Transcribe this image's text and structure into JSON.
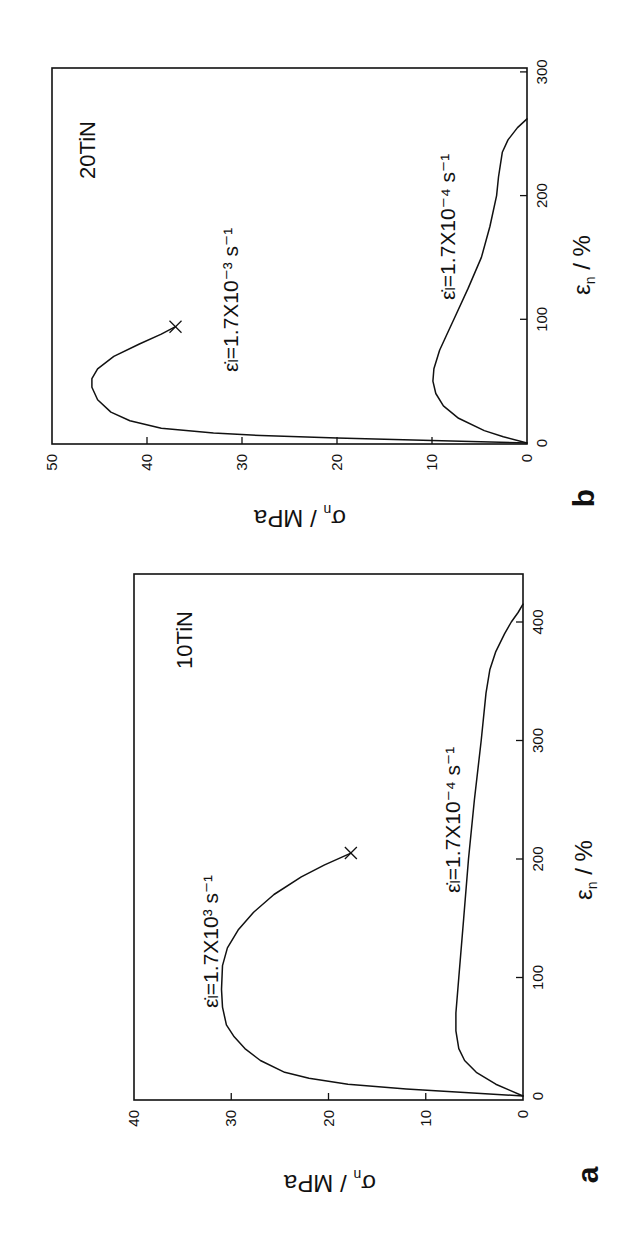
{
  "figure": {
    "rotation_note": "Both panels are printed rotated 90° counter-clockwise on the page",
    "panels": [
      {
        "id": "b",
        "letter": "b",
        "sample": "20TiN",
        "xlabel": "ε",
        "xlabel_sub": "n",
        "xlabel_unit": " / %",
        "ylabel": "σ",
        "ylabel_sub": "n",
        "ylabel_unit": " / MPa",
        "xticks": [
          "0",
          "100",
          "200",
          "300"
        ],
        "yticks": [
          "0",
          "10",
          "20",
          "30",
          "40",
          "50"
        ],
        "series_labels": {
          "high": "ε̇ₗ=1.7X10⁻³ s⁻¹",
          "low": "ε̇ₗ=1.7X10⁻⁴ s⁻¹"
        }
      },
      {
        "id": "a",
        "letter": "a",
        "sample": "10TiN",
        "xlabel": "ε",
        "xlabel_sub": "n",
        "xlabel_unit": " / %",
        "ylabel": "σ",
        "ylabel_sub": "n",
        "ylabel_unit": " / MPa",
        "xticks": [
          "0",
          "100",
          "200",
          "300",
          "400"
        ],
        "yticks": [
          "0",
          "10",
          "20",
          "30",
          "40"
        ],
        "series_labels": {
          "high": "ε̇ₗ=1.7X10³ s⁻¹",
          "low": "ε̇ₗ=1.7X10⁻⁴ s⁻¹"
        }
      }
    ]
  },
  "chart_data": [
    {
      "type": "line",
      "panel": "a",
      "title": "10TiN",
      "xlabel": "εn / %",
      "ylabel": "σn / MPa",
      "xlim": [
        0,
        420
      ],
      "ylim": [
        0,
        40
      ],
      "xticks": [
        0,
        100,
        200,
        300,
        400
      ],
      "yticks": [
        0,
        10,
        20,
        30,
        40
      ],
      "grid": false,
      "series": [
        {
          "name": "ε̇=1.7x10^-3 s^-1",
          "marker_end": "x",
          "x": [
            0,
            3,
            6,
            10,
            15,
            20,
            30,
            40,
            50,
            60,
            75,
            90,
            110,
            125,
            140,
            155,
            170,
            185,
            195,
            205
          ],
          "y": [
            0,
            6,
            12,
            18,
            22,
            24.5,
            27,
            28.6,
            29.7,
            30.5,
            30.9,
            31.0,
            30.9,
            30.4,
            29.3,
            27.7,
            25.6,
            22.8,
            20.4,
            17.7
          ]
        },
        {
          "name": "ε̇=1.7x10^-4 s^-1",
          "x": [
            0,
            5,
            10,
            20,
            30,
            40,
            55,
            70,
            100,
            150,
            200,
            250,
            300,
            340,
            360,
            375,
            390,
            400,
            408,
            415
          ],
          "y": [
            0,
            1.4,
            2.8,
            4.8,
            6.0,
            6.6,
            6.9,
            6.9,
            6.6,
            6.1,
            5.6,
            5.0,
            4.3,
            3.8,
            3.4,
            2.8,
            1.9,
            1.2,
            0.5,
            0
          ]
        }
      ]
    },
    {
      "type": "line",
      "panel": "b",
      "title": "20TiN",
      "xlabel": "εn / %",
      "ylabel": "σn / MPa",
      "xlim": [
        0,
        300
      ],
      "ylim": [
        0,
        50
      ],
      "xticks": [
        0,
        100,
        200,
        300
      ],
      "yticks": [
        0,
        10,
        20,
        30,
        40,
        50
      ],
      "grid": false,
      "series": [
        {
          "name": "ε̇=1.7x10^-3 s^-1",
          "marker_end": "x",
          "x": [
            0,
            2,
            4,
            6,
            8,
            12,
            18,
            25,
            35,
            45,
            52,
            60,
            70,
            80,
            88,
            94
          ],
          "y": [
            0,
            10,
            20,
            28,
            33,
            38.5,
            41.8,
            43.8,
            45.2,
            45.8,
            45.8,
            45.2,
            43.5,
            40.8,
            38.5,
            37.0
          ]
        },
        {
          "name": "ε̇=1.7x10^-4 s^-1",
          "x": [
            0,
            5,
            10,
            20,
            30,
            40,
            50,
            60,
            75,
            90,
            100,
            125,
            150,
            175,
            200,
            215,
            225,
            235,
            245,
            255,
            262
          ],
          "y": [
            0,
            2.5,
            4.5,
            7.2,
            8.8,
            9.6,
            9.9,
            9.8,
            9.2,
            8.3,
            7.7,
            6.2,
            4.8,
            3.9,
            3.2,
            3.0,
            2.8,
            2.6,
            2.0,
            1.0,
            0
          ]
        }
      ]
    }
  ]
}
